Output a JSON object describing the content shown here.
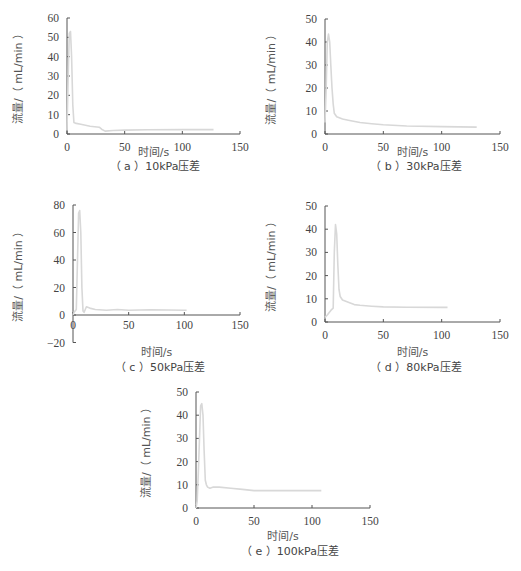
{
  "figure": {
    "panel_count": 5
  },
  "chart_data": [
    {
      "id": "a",
      "type": "line",
      "title": "",
      "caption": "（ a ）10kPa压差",
      "xlabel": "时间/s",
      "ylabel": "流量/（ mL/min ）",
      "xlim": [
        0,
        150
      ],
      "ylim": [
        0,
        60
      ],
      "xticks": [
        0,
        50,
        100,
        150
      ],
      "yticks": [
        0,
        10,
        20,
        30,
        40,
        50,
        60
      ],
      "grid": false,
      "legend": null,
      "line_color": "#d8d8d8",
      "series": [
        {
          "name": "10kPa",
          "x": [
            0,
            1,
            2,
            3,
            4,
            5,
            6,
            8,
            12,
            20,
            28,
            30,
            33,
            40,
            50,
            70,
            100,
            127
          ],
          "y": [
            2,
            30,
            52,
            53,
            40,
            15,
            6,
            5.5,
            5,
            4,
            3.5,
            2.5,
            1.5,
            1.8,
            2,
            2.2,
            2.3,
            2.3
          ]
        }
      ]
    },
    {
      "id": "b",
      "type": "line",
      "title": "",
      "caption": "（ b ）30kPa压差",
      "xlabel": "时间/s",
      "ylabel": "流量/（ mL/min ）",
      "xlim": [
        0,
        150
      ],
      "ylim": [
        0,
        50
      ],
      "xticks": [
        0,
        50,
        100,
        150
      ],
      "yticks": [
        0,
        10,
        20,
        30,
        40,
        50
      ],
      "grid": false,
      "legend": null,
      "line_color": "#d8d8d8",
      "series": [
        {
          "name": "30kPa",
          "x": [
            0,
            1,
            2,
            3,
            4,
            5,
            6,
            7,
            8,
            10,
            15,
            20,
            30,
            40,
            50,
            70,
            100,
            130
          ],
          "y": [
            5,
            20,
            40,
            43.5,
            40,
            30,
            20,
            13,
            9,
            7.5,
            6.5,
            6,
            5,
            4.5,
            4,
            3.5,
            3.2,
            3
          ]
        }
      ]
    },
    {
      "id": "c",
      "type": "line",
      "title": "",
      "caption": "（ c ）50kPa压差",
      "xlabel": "时间/s",
      "ylabel": "流量/（ mL/min ）",
      "xlim": [
        0,
        150
      ],
      "ylim": [
        -20,
        80
      ],
      "xticks": [
        0,
        50,
        100,
        150
      ],
      "yticks": [
        -20,
        0,
        20,
        40,
        60,
        80
      ],
      "grid": false,
      "legend": null,
      "line_color": "#d8d8d8",
      "series": [
        {
          "name": "50kPa",
          "x": [
            0,
            1,
            3,
            4,
            5,
            6,
            7,
            8,
            9,
            10,
            12,
            15,
            20,
            30,
            40,
            50,
            70,
            100,
            102
          ],
          "y": [
            0,
            2,
            4,
            40,
            74,
            76,
            60,
            20,
            3,
            2,
            6,
            5,
            4,
            3.5,
            4,
            3.5,
            3.8,
            3.5,
            3.5
          ]
        }
      ]
    },
    {
      "id": "d",
      "type": "line",
      "title": "",
      "caption": "（ d ）80kPa压差",
      "xlabel": "时间/s",
      "ylabel": "流量/（ mL/min ）",
      "xlim": [
        0,
        150
      ],
      "ylim": [
        0,
        50
      ],
      "xticks": [
        0,
        50,
        100,
        150
      ],
      "yticks": [
        0,
        10,
        20,
        30,
        40,
        50
      ],
      "grid": false,
      "legend": null,
      "line_color": "#d8d8d8",
      "series": [
        {
          "name": "80kPa",
          "x": [
            0,
            2,
            5,
            7,
            8,
            9,
            10,
            11,
            12,
            13,
            15,
            20,
            25,
            30,
            40,
            50,
            70,
            100,
            105
          ],
          "y": [
            2,
            3,
            5,
            6,
            30,
            42,
            38,
            25,
            14,
            11,
            9.5,
            8.5,
            7.5,
            7.2,
            6.8,
            6.5,
            6.4,
            6.3,
            6.3
          ]
        }
      ]
    },
    {
      "id": "e",
      "type": "line",
      "title": "",
      "caption": "（ e ）100kPa压差",
      "xlabel": "时间/s",
      "ylabel": "流量/（ mL/min ）",
      "xlim": [
        0,
        150
      ],
      "ylim": [
        0,
        50
      ],
      "xticks": [
        0,
        50,
        100,
        150
      ],
      "yticks": [
        0,
        10,
        20,
        30,
        40,
        50
      ],
      "grid": false,
      "legend": null,
      "line_color": "#d8d8d8",
      "series": [
        {
          "name": "100kPa",
          "x": [
            0,
            1,
            2,
            3,
            4,
            5,
            6,
            7,
            8,
            9,
            10,
            12,
            15,
            20,
            30,
            40,
            50,
            70,
            100,
            108
          ],
          "y": [
            0,
            3,
            15,
            30,
            44,
            45,
            40,
            25,
            12,
            10,
            9,
            8.5,
            9,
            9,
            8.5,
            8,
            7.5,
            7.5,
            7.5,
            7.5
          ]
        }
      ]
    }
  ],
  "layout": {
    "panels": [
      {
        "ox": 67,
        "oy0": 134,
        "ytop": 18,
        "xend": 240,
        "ymin_px": 134,
        "ylabel_x": 22,
        "caption_x": 125,
        "caption_y": 170,
        "xlabel_y": 156
      },
      {
        "ox": 325,
        "oy0": 134,
        "ytop": 19,
        "xend": 500,
        "ymin_px": 134,
        "ylabel_x": 275,
        "caption_x": 386,
        "caption_y": 170,
        "xlabel_y": 156
      },
      {
        "ox": 73,
        "oy0": 315,
        "ytop": 205,
        "xend": 240,
        "ymin_px": 343,
        "ylabel_x": 22,
        "caption_x": 130,
        "caption_y": 371,
        "xlabel_y": 356
      },
      {
        "ox": 325,
        "oy0": 322,
        "ytop": 206,
        "xend": 500,
        "ymin_px": 322,
        "ylabel_x": 275,
        "caption_x": 386,
        "caption_y": 371,
        "xlabel_y": 356
      },
      {
        "ox": 196,
        "oy0": 508,
        "ytop": 392,
        "xend": 370,
        "ymin_px": 508,
        "ylabel_x": 150,
        "caption_x": 260,
        "caption_y": 555,
        "xlabel_y": 540
      }
    ]
  }
}
